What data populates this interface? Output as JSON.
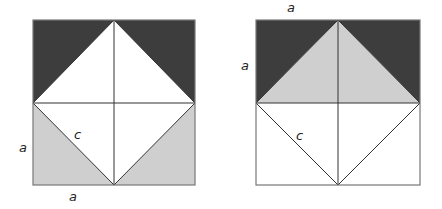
{
  "colors": {
    "dark": "#3d3d3d",
    "light": "#cfcfcf",
    "white": "#ffffff",
    "line": "#333333",
    "border": "#777777"
  },
  "left_figure": {
    "labels": {
      "side_vertical": "a",
      "side_horizontal": "a",
      "hypotenuse": "c"
    },
    "regions": [
      {
        "name": "top-left-triangle",
        "fill": "dark"
      },
      {
        "name": "top-right-triangle",
        "fill": "dark"
      },
      {
        "name": "bottom-left-triangle",
        "fill": "light"
      },
      {
        "name": "bottom-right-triangle",
        "fill": "light"
      },
      {
        "name": "inner-diamond",
        "fill": "white"
      }
    ]
  },
  "right_figure": {
    "labels": {
      "side_horizontal": "a",
      "side_vertical": "a",
      "hypotenuse": "c"
    },
    "regions": [
      {
        "name": "top-left-triangle",
        "fill": "dark"
      },
      {
        "name": "top-right-triangle",
        "fill": "dark"
      },
      {
        "name": "top-center-triangle",
        "fill": "light"
      },
      {
        "name": "bottom-half",
        "fill": "white"
      }
    ]
  }
}
